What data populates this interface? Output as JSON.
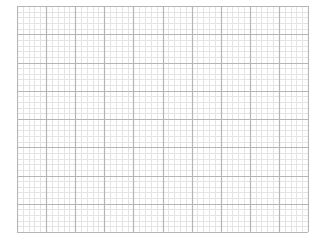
{
  "grid": {
    "columns": 10,
    "rows": 8,
    "minor_per_major": 5,
    "colors": {
      "background": "#ffffff",
      "major_line": "#b5b5b5",
      "minor_line": "#e4e4e4",
      "border": "#b0b0b0"
    }
  }
}
